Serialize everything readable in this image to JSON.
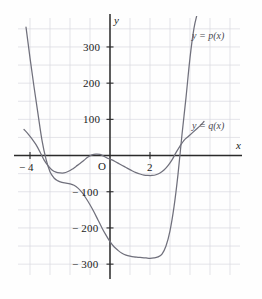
{
  "figure": {
    "kind": "cartesian-graph",
    "background_color": "#fefefe",
    "grid_color": "#d8d8e0",
    "axis_color": "#2b2b2b",
    "curve_color": "#70707c"
  },
  "axes": {
    "x_axis_label": "x",
    "y_axis_label": "y",
    "origin_label": "O",
    "x_ticks": [
      {
        "label": "− 4",
        "value": -4
      },
      {
        "label": "2",
        "value": 2
      }
    ],
    "y_ticks": [
      {
        "label": "300",
        "value": 300
      },
      {
        "label": "200",
        "value": 200
      },
      {
        "label": "100",
        "value": 100
      },
      {
        "label": "− 100",
        "value": -100
      },
      {
        "label": "− 200",
        "value": -200
      },
      {
        "label": "− 300",
        "value": -300
      }
    ]
  },
  "curve_labels": {
    "p": "y  =  p(x)",
    "q": "y  =  q(x)"
  },
  "chart_data": {
    "type": "line",
    "title": "",
    "xlabel": "x",
    "ylabel": "y",
    "xlim": [
      -4.6,
      6.5
    ],
    "ylim": [
      -330,
      380
    ],
    "grid": true,
    "grid_x_step": 1,
    "grid_y_step": 50,
    "legend_position": "inline-right",
    "x_ticks_shown": [
      -4,
      2
    ],
    "y_ticks_shown": [
      300,
      200,
      100,
      -100,
      -200,
      -300
    ],
    "annotations": [
      {
        "text": "y  =  p(x)",
        "x": 4.6,
        "y": 340
      },
      {
        "text": "y  =  q(x)",
        "x": 4.6,
        "y": 90
      },
      {
        "text": "O",
        "x": -0.28,
        "y": -32
      }
    ],
    "series": [
      {
        "name": "y = p(x)",
        "color": "#70707c",
        "roots": [
          -3.4,
          3.85
        ],
        "local_minima": [
          {
            "x": 2.6,
            "y": -280
          }
        ],
        "x": [
          -4.2,
          -4.0,
          -3.8,
          -3.6,
          -3.4,
          -3.2,
          -3.0,
          -2.8,
          -2.6,
          -2.4,
          -2.2,
          -2.0,
          -1.8,
          -1.6,
          -1.4,
          -1.2,
          -1.0,
          -0.8,
          -0.6,
          -0.4,
          -0.2,
          0.0,
          0.2,
          0.4,
          0.6,
          0.8,
          1.0,
          1.2,
          1.4,
          1.6,
          1.8,
          2.0,
          2.2,
          2.4,
          2.6,
          2.8,
          3.0,
          3.2,
          3.4,
          3.6,
          3.8,
          4.0,
          4.2,
          4.4
        ],
        "y": [
          355,
          270,
          190,
          115,
          42,
          -10,
          -45,
          -62,
          -70,
          -74,
          -76,
          -78,
          -82,
          -90,
          -102,
          -118,
          -136,
          -156,
          -178,
          -200,
          -220,
          -238,
          -252,
          -262,
          -270,
          -275,
          -278,
          -280,
          -281,
          -282,
          -283,
          -284,
          -283,
          -280,
          -272,
          -250,
          -208,
          -142,
          -52,
          58,
          160,
          270,
          352,
          400
        ]
      },
      {
        "name": "y = q(x)",
        "color": "#70707c",
        "roots": [
          -3.45,
          -1.15,
          0.0,
          3.8
        ],
        "local_minima": [
          {
            "x": -2.4,
            "y": -48
          },
          {
            "x": 2.1,
            "y": -55
          }
        ],
        "local_maxima": [
          {
            "x": -0.6,
            "y": 4
          }
        ],
        "x": [
          -4.3,
          -4.1,
          -3.9,
          -3.7,
          -3.5,
          -3.3,
          -3.1,
          -2.9,
          -2.7,
          -2.5,
          -2.3,
          -2.1,
          -1.9,
          -1.7,
          -1.5,
          -1.3,
          -1.1,
          -0.9,
          -0.7,
          -0.5,
          -0.3,
          -0.1,
          0.1,
          0.3,
          0.5,
          0.7,
          0.9,
          1.1,
          1.3,
          1.5,
          1.7,
          1.9,
          2.1,
          2.3,
          2.5,
          2.7,
          2.9,
          3.1,
          3.3,
          3.5,
          3.7,
          3.9,
          4.1,
          4.3,
          4.5,
          4.7
        ],
        "y": [
          72,
          60,
          46,
          30,
          10,
          -12,
          -28,
          -40,
          -46,
          -48,
          -48,
          -44,
          -38,
          -30,
          -22,
          -13,
          -4,
          2,
          4,
          3,
          -2,
          -8,
          -12,
          -18,
          -24,
          -30,
          -36,
          -42,
          -47,
          -51,
          -54,
          -55,
          -55,
          -53,
          -48,
          -40,
          -28,
          -12,
          8,
          26,
          42,
          52,
          62,
          72,
          82,
          94
        ]
      }
    ]
  }
}
